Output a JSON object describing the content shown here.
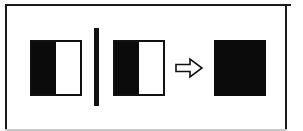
{
  "figure": {
    "background_color": "#ffffff",
    "frame": {
      "name": "outer-frame",
      "color": "#1a1a1a",
      "bottom_edge_color": "#c8c8c8",
      "visible_sides": "top, left, right (bottom faint/cropped)"
    },
    "shapes": [
      {
        "id": "square-left",
        "kind": "split-square",
        "label": "",
        "left_half_color": "#0b0b0b",
        "right_half_color": "#ffffff",
        "outline_color": "#111111",
        "x": 30,
        "y": 40,
        "width": 52,
        "height": 56
      },
      {
        "id": "divider-bar",
        "kind": "vertical-bar",
        "label": "",
        "color": "#111111",
        "x": 94,
        "y": 28,
        "width": 5,
        "height": 78
      },
      {
        "id": "square-middle",
        "kind": "split-square",
        "label": "",
        "left_half_color": "#0b0b0b",
        "right_half_color": "#ffffff",
        "outline_color": "#111111",
        "x": 113,
        "y": 40,
        "width": 52,
        "height": 56
      },
      {
        "id": "arrow-right",
        "kind": "arrow",
        "direction": "right",
        "label": "",
        "glyph": "⇨",
        "fill_color": "#ffffff",
        "outline_color": "#111111",
        "x": 175,
        "y": 56,
        "width": 28,
        "height": 24
      },
      {
        "id": "square-right",
        "kind": "solid-square",
        "label": "",
        "fill_color": "#0b0b0b",
        "x": 214,
        "y": 40,
        "width": 52,
        "height": 56
      }
    ]
  }
}
